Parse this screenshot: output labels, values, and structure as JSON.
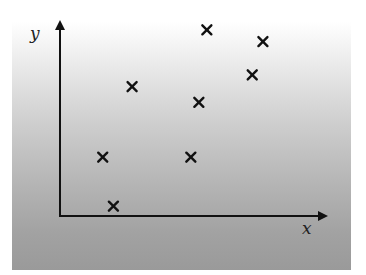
{
  "chart_data": {
    "type": "scatter",
    "title": "",
    "xlabel": "x",
    "ylabel": "y",
    "marker": "x",
    "marker_color": "#111111",
    "axis_color": "#111111",
    "grid": false,
    "legend": null,
    "ticks": false,
    "xlim": [
      0,
      10
    ],
    "ylim": [
      0,
      10
    ],
    "series": [
      {
        "name": "points",
        "points": [
          {
            "x": 2.0,
            "y": 0.5
          },
          {
            "x": 1.6,
            "y": 3.0
          },
          {
            "x": 2.7,
            "y": 6.6
          },
          {
            "x": 4.9,
            "y": 3.0
          },
          {
            "x": 5.2,
            "y": 5.8
          },
          {
            "x": 5.5,
            "y": 9.5
          },
          {
            "x": 7.2,
            "y": 7.2
          },
          {
            "x": 7.6,
            "y": 8.9
          }
        ]
      }
    ],
    "background": {
      "style": "vertical-gradient",
      "top_color": "#ffffff",
      "bottom_color": "#9a9a9a"
    }
  },
  "labels": {
    "x_axis": "x",
    "y_axis": "y"
  }
}
